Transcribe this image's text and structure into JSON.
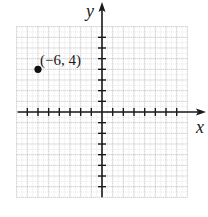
{
  "chart_data": {
    "type": "scatter",
    "title": "",
    "xlabel": "x",
    "ylabel": "y",
    "xlim": [
      -8,
      8
    ],
    "ylim": [
      -8,
      8
    ],
    "grid": true,
    "grid_minor": true,
    "ticks": [
      -7,
      -6,
      -5,
      -4,
      -3,
      -2,
      -1,
      1,
      2,
      3,
      4,
      5,
      6,
      7
    ],
    "tick_labels_shown": false,
    "points": [
      {
        "x": -6,
        "y": 4,
        "label": "(−6, 4)"
      }
    ]
  },
  "axes": {
    "x_label": "x",
    "y_label": "y"
  },
  "colors": {
    "axis": "#1a1a1a",
    "grid_major": "#b8b8b8",
    "grid_minor": "#d6d6d6",
    "point": "#111111"
  }
}
